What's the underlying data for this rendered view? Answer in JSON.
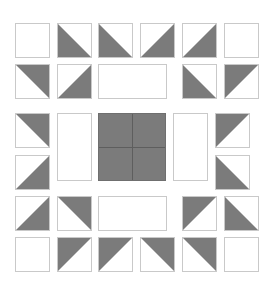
{
  "title": "",
  "colors": {
    "dark": "#7b7b7b",
    "border": "#c9c9c9",
    "background": "#ffffff",
    "seam": "#5e5e5e"
  },
  "quilt": {
    "description": "Quilt block pattern: border of half-square triangles surrounding a central four-patch",
    "pieces": [
      {
        "id": "r0c0",
        "kind": "square",
        "fill": "none",
        "x": 15,
        "y": 23,
        "w": 35,
        "h": 35
      },
      {
        "id": "r0c1",
        "kind": "hst",
        "dark": "bl",
        "x": 57,
        "y": 23,
        "w": 35,
        "h": 35
      },
      {
        "id": "r0c2",
        "kind": "hst",
        "dark": "bl",
        "x": 98,
        "y": 23,
        "w": 35,
        "h": 35
      },
      {
        "id": "r0c3",
        "kind": "hst",
        "dark": "br",
        "x": 140,
        "y": 23,
        "w": 35,
        "h": 35
      },
      {
        "id": "r0c4",
        "kind": "hst",
        "dark": "br",
        "x": 182,
        "y": 23,
        "w": 35,
        "h": 35
      },
      {
        "id": "r0c5",
        "kind": "square",
        "fill": "none",
        "x": 224,
        "y": 23,
        "w": 35,
        "h": 35
      },
      {
        "id": "r1c0",
        "kind": "hst",
        "dark": "tr",
        "x": 15,
        "y": 64,
        "w": 35,
        "h": 35
      },
      {
        "id": "r1c1",
        "kind": "hst",
        "dark": "br",
        "x": 57,
        "y": 64,
        "w": 35,
        "h": 35
      },
      {
        "id": "r1rect",
        "kind": "rect",
        "fill": "none",
        "x": 98,
        "y": 64,
        "w": 69,
        "h": 35
      },
      {
        "id": "r1c4",
        "kind": "hst",
        "dark": "bl",
        "x": 182,
        "y": 64,
        "w": 35,
        "h": 35
      },
      {
        "id": "r1c5",
        "kind": "hst",
        "dark": "tl",
        "x": 224,
        "y": 64,
        "w": 35,
        "h": 35
      },
      {
        "id": "m0left",
        "kind": "hst",
        "dark": "tr",
        "x": 15,
        "y": 113,
        "w": 35,
        "h": 35
      },
      {
        "id": "m1left",
        "kind": "hst",
        "dark": "br",
        "x": 15,
        "y": 155,
        "w": 35,
        "h": 35
      },
      {
        "id": "mTallLeft",
        "kind": "rect",
        "fill": "none",
        "x": 57,
        "y": 113,
        "w": 35,
        "h": 68
      },
      {
        "id": "center",
        "kind": "fourpatch",
        "fill": "dark",
        "x": 98,
        "y": 113,
        "w": 68,
        "h": 68
      },
      {
        "id": "mTallRight",
        "kind": "rect",
        "fill": "none",
        "x": 173,
        "y": 113,
        "w": 35,
        "h": 68
      },
      {
        "id": "m0right",
        "kind": "hst",
        "dark": "tl",
        "x": 215,
        "y": 113,
        "w": 35,
        "h": 35
      },
      {
        "id": "m1right",
        "kind": "hst",
        "dark": "bl",
        "x": 215,
        "y": 155,
        "w": 35,
        "h": 35
      },
      {
        "id": "r4c0",
        "kind": "hst",
        "dark": "br",
        "x": 15,
        "y": 196,
        "w": 35,
        "h": 35
      },
      {
        "id": "r4c1",
        "kind": "hst",
        "dark": "tr",
        "x": 57,
        "y": 196,
        "w": 35,
        "h": 35
      },
      {
        "id": "r4rect",
        "kind": "rect",
        "fill": "none",
        "x": 98,
        "y": 196,
        "w": 69,
        "h": 35
      },
      {
        "id": "r4c4",
        "kind": "hst",
        "dark": "tl",
        "x": 182,
        "y": 196,
        "w": 35,
        "h": 35
      },
      {
        "id": "r4c5",
        "kind": "hst",
        "dark": "bl",
        "x": 224,
        "y": 196,
        "w": 35,
        "h": 35
      },
      {
        "id": "r5c0",
        "kind": "square",
        "fill": "none",
        "x": 15,
        "y": 237,
        "w": 35,
        "h": 35
      },
      {
        "id": "r5c1",
        "kind": "hst",
        "dark": "tl",
        "x": 57,
        "y": 237,
        "w": 35,
        "h": 35
      },
      {
        "id": "r5c2",
        "kind": "hst",
        "dark": "tl",
        "x": 98,
        "y": 237,
        "w": 35,
        "h": 35
      },
      {
        "id": "r5c3",
        "kind": "hst",
        "dark": "tr",
        "x": 140,
        "y": 237,
        "w": 35,
        "h": 35
      },
      {
        "id": "r5c4",
        "kind": "hst",
        "dark": "tr",
        "x": 182,
        "y": 237,
        "w": 35,
        "h": 35
      },
      {
        "id": "r5c5",
        "kind": "square",
        "fill": "none",
        "x": 224,
        "y": 237,
        "w": 35,
        "h": 35
      }
    ]
  }
}
